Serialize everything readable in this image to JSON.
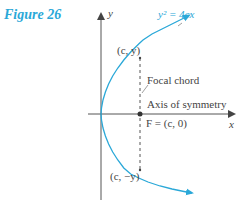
{
  "figure": {
    "label": "Figure 26"
  },
  "diagram": {
    "equation": "y² = 4cx",
    "axes": {
      "x_label": "x",
      "y_label": "y"
    },
    "points": {
      "upper": "(c, y)",
      "lower": "(c, −y)",
      "focus": "F = (c, 0)"
    },
    "annotations": {
      "focal_chord": "Focal chord",
      "axis_of_symmetry": "Axis of symmetry"
    },
    "colors": {
      "curve": "#2aa8d8",
      "axes": "#444444",
      "label_accent": "#2aa8d8"
    }
  }
}
